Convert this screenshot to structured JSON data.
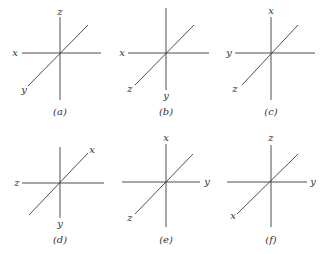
{
  "panels": [
    {
      "caption": "(a)",
      "up": "z",
      "left": "x",
      "right": "",
      "diag_low": "y",
      "diag_high": "",
      "down": ""
    },
    {
      "caption": "(b)",
      "up": "",
      "left": "x",
      "right": "",
      "diag_low": "z",
      "diag_high": "",
      "down": "y"
    },
    {
      "caption": "(c)",
      "up": "x",
      "left": "y",
      "right": "",
      "diag_low": "z",
      "diag_high": "",
      "down": ""
    },
    {
      "caption": "(d)",
      "up": "",
      "left": "z",
      "right": "",
      "diag_low": "",
      "diag_high": "x",
      "down": "y"
    },
    {
      "caption": "(e)",
      "up": "x",
      "left": "",
      "right": "y",
      "diag_low": "z",
      "diag_high": "",
      "down": ""
    },
    {
      "caption": "(f)",
      "up": "z",
      "left": "",
      "right": "y",
      "diag_low": "x",
      "diag_high": "",
      "down": ""
    }
  ]
}
